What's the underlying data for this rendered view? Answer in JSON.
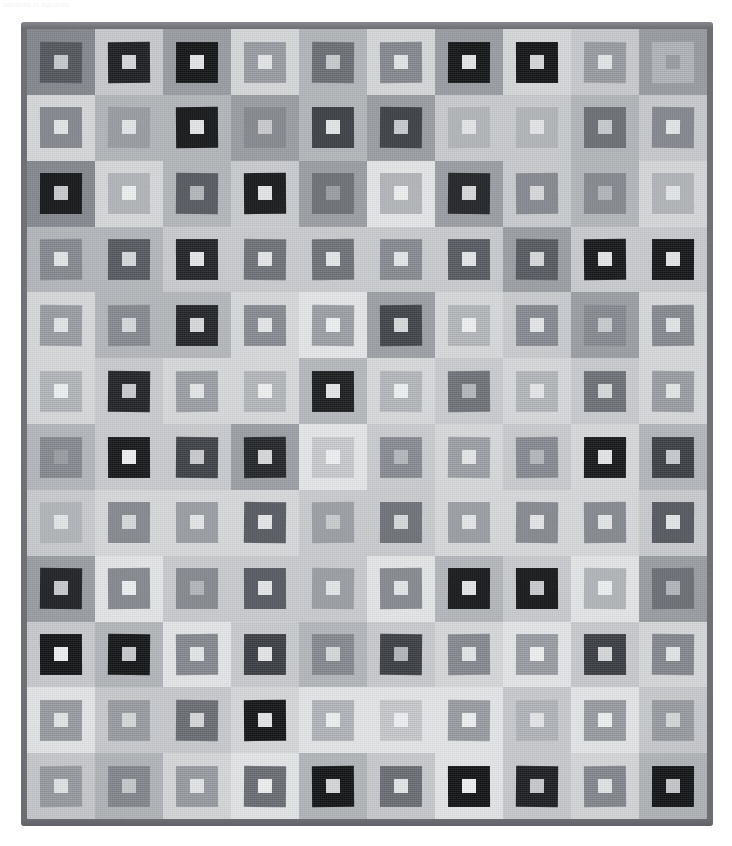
{
  "caption": {
    "text": "squares in squares"
  },
  "artwork": {
    "title": "Squares in Squares Quilt",
    "type": "photograph",
    "grid_columns": 10,
    "grid_rows": 12,
    "border_color": "#6e7076",
    "background_color": "#ffffff"
  },
  "palette": {
    "black": "#131416",
    "near_black": "#1d1f22",
    "charcoal": "#3a3d42",
    "dark_gray": "#54585e",
    "mid_dark_gray": "#6b6f75",
    "mid_gray": "#85898f",
    "gray": "#9a9ea3",
    "light_gray": "#b3b6ba",
    "pale_gray": "#c8cacd",
    "lighter_gray": "#d6d8da",
    "near_white": "#e4e5e6",
    "white": "#eeeff0"
  },
  "grid": {
    "rows": [
      {
        "index": 1,
        "cells": [
          {
            "bg": "#85898f",
            "mid": "#54585e",
            "core": "#c8cacd"
          },
          {
            "bg": "#c8cacd",
            "mid": "#1d1f22",
            "core": "#d6d8da"
          },
          {
            "bg": "#9a9ea3",
            "mid": "#131416",
            "core": "#e4e5e6"
          },
          {
            "bg": "#d6d8da",
            "mid": "#9a9ea3",
            "core": "#e4e5e6"
          },
          {
            "bg": "#b3b6ba",
            "mid": "#6b6f75",
            "core": "#c8cacd"
          },
          {
            "bg": "#d6d8da",
            "mid": "#85898f",
            "core": "#e4e5e6"
          },
          {
            "bg": "#9a9ea3",
            "mid": "#131416",
            "core": "#e4e5e6"
          },
          {
            "bg": "#d6d8da",
            "mid": "#131416",
            "core": "#d6d8da"
          },
          {
            "bg": "#c8cacd",
            "mid": "#9a9ea3",
            "core": "#e4e5e6"
          },
          {
            "bg": "#9a9ea3",
            "mid": "#b3b6ba",
            "core": "#9a9ea3"
          }
        ]
      },
      {
        "index": 2,
        "cells": [
          {
            "bg": "#d6d8da",
            "mid": "#85898f",
            "core": "#e4e5e6"
          },
          {
            "bg": "#b3b6ba",
            "mid": "#9a9ea3",
            "core": "#e4e5e6"
          },
          {
            "bg": "#b3b6ba",
            "mid": "#131416",
            "core": "#e4e5e6"
          },
          {
            "bg": "#9a9ea3",
            "mid": "#85898f",
            "core": "#c8cacd"
          },
          {
            "bg": "#b3b6ba",
            "mid": "#3a3d42",
            "core": "#e4e5e6"
          },
          {
            "bg": "#9a9ea3",
            "mid": "#3a3d42",
            "core": "#c8cacd"
          },
          {
            "bg": "#c8cacd",
            "mid": "#b3b6ba",
            "core": "#e4e5e6"
          },
          {
            "bg": "#c8cacd",
            "mid": "#b3b6ba",
            "core": "#e4e5e6"
          },
          {
            "bg": "#b3b6ba",
            "mid": "#6b6f75",
            "core": "#c8cacd"
          },
          {
            "bg": "#c8cacd",
            "mid": "#85898f",
            "core": "#e4e5e6"
          }
        ]
      },
      {
        "index": 3,
        "cells": [
          {
            "bg": "#85898f",
            "mid": "#131416",
            "core": "#c8cacd"
          },
          {
            "bg": "#d6d8da",
            "mid": "#b3b6ba",
            "core": "#eeeff0"
          },
          {
            "bg": "#b3b6ba",
            "mid": "#54585e",
            "core": "#b3b6ba"
          },
          {
            "bg": "#c8cacd",
            "mid": "#131416",
            "core": "#e4e5e6"
          },
          {
            "bg": "#9a9ea3",
            "mid": "#6b6f75",
            "core": "#9a9ea3"
          },
          {
            "bg": "#e4e5e6",
            "mid": "#b3b6ba",
            "core": "#eeeff0"
          },
          {
            "bg": "#9a9ea3",
            "mid": "#1d1f22",
            "core": "#d6d8da"
          },
          {
            "bg": "#c8cacd",
            "mid": "#85898f",
            "core": "#d6d8da"
          },
          {
            "bg": "#b3b6ba",
            "mid": "#85898f",
            "core": "#b3b6ba"
          },
          {
            "bg": "#d6d8da",
            "mid": "#b3b6ba",
            "core": "#e4e5e6"
          }
        ]
      },
      {
        "index": 4,
        "cells": [
          {
            "bg": "#b3b6ba",
            "mid": "#85898f",
            "core": "#e4e5e6"
          },
          {
            "bg": "#b3b6ba",
            "mid": "#54585e",
            "core": "#d6d8da"
          },
          {
            "bg": "#c8cacd",
            "mid": "#1d1f22",
            "core": "#e4e5e6"
          },
          {
            "bg": "#c8cacd",
            "mid": "#6b6f75",
            "core": "#e4e5e6"
          },
          {
            "bg": "#c8cacd",
            "mid": "#6b6f75",
            "core": "#e4e5e6"
          },
          {
            "bg": "#c8cacd",
            "mid": "#85898f",
            "core": "#e4e5e6"
          },
          {
            "bg": "#c8cacd",
            "mid": "#54585e",
            "core": "#e4e5e6"
          },
          {
            "bg": "#9a9ea3",
            "mid": "#54585e",
            "core": "#d6d8da"
          },
          {
            "bg": "#c8cacd",
            "mid": "#131416",
            "core": "#e4e5e6"
          },
          {
            "bg": "#c8cacd",
            "mid": "#131416",
            "core": "#e4e5e6"
          }
        ]
      },
      {
        "index": 5,
        "cells": [
          {
            "bg": "#d6d8da",
            "mid": "#9a9ea3",
            "core": "#e4e5e6"
          },
          {
            "bg": "#b3b6ba",
            "mid": "#85898f",
            "core": "#d6d8da"
          },
          {
            "bg": "#b3b6ba",
            "mid": "#1d1f22",
            "core": "#d6d8da"
          },
          {
            "bg": "#d6d8da",
            "mid": "#85898f",
            "core": "#e4e5e6"
          },
          {
            "bg": "#e4e5e6",
            "mid": "#9a9ea3",
            "core": "#eeeff0"
          },
          {
            "bg": "#9a9ea3",
            "mid": "#3a3d42",
            "core": "#d6d8da"
          },
          {
            "bg": "#d6d8da",
            "mid": "#b3b6ba",
            "core": "#eeeff0"
          },
          {
            "bg": "#c8cacd",
            "mid": "#85898f",
            "core": "#e4e5e6"
          },
          {
            "bg": "#9a9ea3",
            "mid": "#85898f",
            "core": "#c8cacd"
          },
          {
            "bg": "#d6d8da",
            "mid": "#85898f",
            "core": "#e4e5e6"
          }
        ]
      },
      {
        "index": 6,
        "cells": [
          {
            "bg": "#d6d8da",
            "mid": "#b3b6ba",
            "core": "#eeeff0"
          },
          {
            "bg": "#c8cacd",
            "mid": "#1d1f22",
            "core": "#c8cacd"
          },
          {
            "bg": "#d6d8da",
            "mid": "#9a9ea3",
            "core": "#e4e5e6"
          },
          {
            "bg": "#d6d8da",
            "mid": "#b3b6ba",
            "core": "#eeeff0"
          },
          {
            "bg": "#b3b6ba",
            "mid": "#131416",
            "core": "#e4e5e6"
          },
          {
            "bg": "#d6d8da",
            "mid": "#b3b6ba",
            "core": "#eeeff0"
          },
          {
            "bg": "#c8cacd",
            "mid": "#6b6f75",
            "core": "#b3b6ba"
          },
          {
            "bg": "#d6d8da",
            "mid": "#b3b6ba",
            "core": "#e4e5e6"
          },
          {
            "bg": "#c8cacd",
            "mid": "#6b6f75",
            "core": "#d6d8da"
          },
          {
            "bg": "#d6d8da",
            "mid": "#9a9ea3",
            "core": "#e4e5e6"
          }
        ]
      },
      {
        "index": 7,
        "cells": [
          {
            "bg": "#b3b6ba",
            "mid": "#85898f",
            "core": "#9a9ea3"
          },
          {
            "bg": "#c8cacd",
            "mid": "#131416",
            "core": "#eeeff0"
          },
          {
            "bg": "#c8cacd",
            "mid": "#3a3d42",
            "core": "#c8cacd"
          },
          {
            "bg": "#9a9ea3",
            "mid": "#1d1f22",
            "core": "#d6d8da"
          },
          {
            "bg": "#e4e5e6",
            "mid": "#c8cacd",
            "core": "#eeeff0"
          },
          {
            "bg": "#c8cacd",
            "mid": "#85898f",
            "core": "#b3b6ba"
          },
          {
            "bg": "#d6d8da",
            "mid": "#9a9ea3",
            "core": "#e4e5e6"
          },
          {
            "bg": "#c8cacd",
            "mid": "#85898f",
            "core": "#b3b6ba"
          },
          {
            "bg": "#d6d8da",
            "mid": "#131416",
            "core": "#e4e5e6"
          },
          {
            "bg": "#b3b6ba",
            "mid": "#3a3d42",
            "core": "#c8cacd"
          }
        ]
      },
      {
        "index": 8,
        "cells": [
          {
            "bg": "#c8cacd",
            "mid": "#b3b6ba",
            "core": "#e4e5e6"
          },
          {
            "bg": "#d6d8da",
            "mid": "#85898f",
            "core": "#d6d8da"
          },
          {
            "bg": "#d6d8da",
            "mid": "#9a9ea3",
            "core": "#e4e5e6"
          },
          {
            "bg": "#d6d8da",
            "mid": "#54585e",
            "core": "#e4e5e6"
          },
          {
            "bg": "#c8cacd",
            "mid": "#9a9ea3",
            "core": "#c8cacd"
          },
          {
            "bg": "#c8cacd",
            "mid": "#6b6f75",
            "core": "#d6d8da"
          },
          {
            "bg": "#d6d8da",
            "mid": "#9a9ea3",
            "core": "#e4e5e6"
          },
          {
            "bg": "#d6d8da",
            "mid": "#85898f",
            "core": "#e4e5e6"
          },
          {
            "bg": "#d6d8da",
            "mid": "#85898f",
            "core": "#e4e5e6"
          },
          {
            "bg": "#c8cacd",
            "mid": "#54585e",
            "core": "#e4e5e6"
          }
        ]
      },
      {
        "index": 9,
        "cells": [
          {
            "bg": "#9a9ea3",
            "mid": "#1d1f22",
            "core": "#c8cacd"
          },
          {
            "bg": "#e4e5e6",
            "mid": "#85898f",
            "core": "#eeeff0"
          },
          {
            "bg": "#c8cacd",
            "mid": "#85898f",
            "core": "#b3b6ba"
          },
          {
            "bg": "#c8cacd",
            "mid": "#54585e",
            "core": "#e4e5e6"
          },
          {
            "bg": "#c8cacd",
            "mid": "#9a9ea3",
            "core": "#e4e5e6"
          },
          {
            "bg": "#e4e5e6",
            "mid": "#85898f",
            "core": "#e4e5e6"
          },
          {
            "bg": "#b3b6ba",
            "mid": "#131416",
            "core": "#e4e5e6"
          },
          {
            "bg": "#c8cacd",
            "mid": "#131416",
            "core": "#c8cacd"
          },
          {
            "bg": "#e4e5e6",
            "mid": "#b3b6ba",
            "core": "#eeeff0"
          },
          {
            "bg": "#9a9ea3",
            "mid": "#6b6f75",
            "core": "#b3b6ba"
          }
        ]
      },
      {
        "index": 10,
        "cells": [
          {
            "bg": "#c8cacd",
            "mid": "#131416",
            "core": "#eeeff0"
          },
          {
            "bg": "#b3b6ba",
            "mid": "#131416",
            "core": "#c8cacd"
          },
          {
            "bg": "#e4e5e6",
            "mid": "#85898f",
            "core": "#e4e5e6"
          },
          {
            "bg": "#c8cacd",
            "mid": "#3a3d42",
            "core": "#e4e5e6"
          },
          {
            "bg": "#b3b6ba",
            "mid": "#85898f",
            "core": "#d6d8da"
          },
          {
            "bg": "#c8cacd",
            "mid": "#3a3d42",
            "core": "#b3b6ba"
          },
          {
            "bg": "#d6d8da",
            "mid": "#85898f",
            "core": "#e4e5e6"
          },
          {
            "bg": "#e4e5e6",
            "mid": "#9a9ea3",
            "core": "#eeeff0"
          },
          {
            "bg": "#c8cacd",
            "mid": "#3a3d42",
            "core": "#d6d8da"
          },
          {
            "bg": "#d6d8da",
            "mid": "#85898f",
            "core": "#e4e5e6"
          }
        ]
      },
      {
        "index": 11,
        "cells": [
          {
            "bg": "#e4e5e6",
            "mid": "#9a9ea3",
            "core": "#e4e5e6"
          },
          {
            "bg": "#c8cacd",
            "mid": "#9a9ea3",
            "core": "#d6d8da"
          },
          {
            "bg": "#c8cacd",
            "mid": "#6b6f75",
            "core": "#d6d8da"
          },
          {
            "bg": "#d6d8da",
            "mid": "#131416",
            "core": "#e4e5e6"
          },
          {
            "bg": "#e4e5e6",
            "mid": "#b3b6ba",
            "core": "#eeeff0"
          },
          {
            "bg": "#e4e5e6",
            "mid": "#c8cacd",
            "core": "#eeeff0"
          },
          {
            "bg": "#e4e5e6",
            "mid": "#9a9ea3",
            "core": "#eeeff0"
          },
          {
            "bg": "#c8cacd",
            "mid": "#b3b6ba",
            "core": "#e4e5e6"
          },
          {
            "bg": "#e4e5e6",
            "mid": "#9a9ea3",
            "core": "#eeeff0"
          },
          {
            "bg": "#c8cacd",
            "mid": "#9a9ea3",
            "core": "#d6d8da"
          }
        ]
      },
      {
        "index": 12,
        "cells": [
          {
            "bg": "#c8cacd",
            "mid": "#9a9ea3",
            "core": "#e4e5e6"
          },
          {
            "bg": "#b3b6ba",
            "mid": "#85898f",
            "core": "#c8cacd"
          },
          {
            "bg": "#d6d8da",
            "mid": "#9a9ea3",
            "core": "#e4e5e6"
          },
          {
            "bg": "#e4e5e6",
            "mid": "#6b6f75",
            "core": "#eeeff0"
          },
          {
            "bg": "#b3b6ba",
            "mid": "#131416",
            "core": "#d6d8da"
          },
          {
            "bg": "#c8cacd",
            "mid": "#6b6f75",
            "core": "#e4e5e6"
          },
          {
            "bg": "#e4e5e6",
            "mid": "#131416",
            "core": "#eeeff0"
          },
          {
            "bg": "#c8cacd",
            "mid": "#1d1f22",
            "core": "#c8cacd"
          },
          {
            "bg": "#d6d8da",
            "mid": "#85898f",
            "core": "#e4e5e6"
          },
          {
            "bg": "#b3b6ba",
            "mid": "#131416",
            "core": "#c8cacd"
          }
        ]
      }
    ]
  }
}
